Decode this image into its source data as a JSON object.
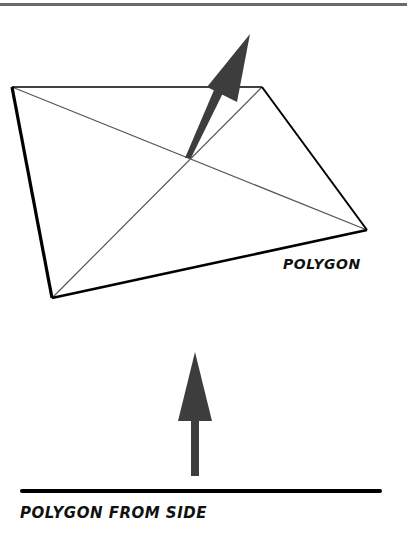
{
  "labels": {
    "polygon": "POLYGON",
    "polygon_from_side": "POLYGON FROM SIDE"
  },
  "colors": {
    "edge": "#000000",
    "diagonal": "#555555",
    "arrow": "#3d3d3d",
    "top_rule": "#6a6a6a"
  },
  "polygon": {
    "vertices": [
      [
        12,
        87
      ],
      [
        262,
        87
      ],
      [
        367,
        230
      ],
      [
        52,
        298
      ]
    ]
  },
  "normal_arrow_3d": {
    "tail": [
      188,
      157
    ],
    "tip": [
      250,
      34
    ]
  },
  "side_view": {
    "line": {
      "x1": 22,
      "x2": 380,
      "y": 491
    },
    "arrow": {
      "tail": [
        195,
        476
      ],
      "tip": [
        195,
        352
      ]
    }
  }
}
